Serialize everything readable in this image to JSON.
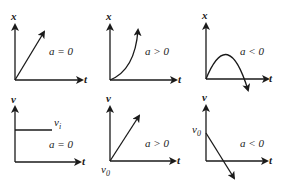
{
  "panels": [
    {
      "id": "x-t-uniform",
      "y_label": "x",
      "x_label": "t",
      "condition": "a = 0",
      "shape": "straight-rising"
    },
    {
      "id": "x-t-accelerating",
      "y_label": "x",
      "x_label": "t",
      "condition": "a > 0",
      "shape": "concave-up-curve"
    },
    {
      "id": "x-t-decelerating",
      "y_label": "x",
      "x_label": "t",
      "condition": "a < 0",
      "shape": "downward-parabola"
    },
    {
      "id": "v-t-uniform",
      "y_label": "v",
      "x_label": "t",
      "condition": "a = 0",
      "shape": "horizontal-line",
      "line_label": "v",
      "line_label_sub": "i"
    },
    {
      "id": "v-t-accelerating",
      "y_label": "v",
      "x_label": "t",
      "condition": "a > 0",
      "shape": "straight-rising",
      "origin_label": "v",
      "origin_label_sub": "0"
    },
    {
      "id": "v-t-decelerating",
      "y_label": "v",
      "x_label": "t",
      "condition": "a < 0",
      "shape": "straight-falling",
      "intercept_label": "v",
      "intercept_label_sub": "0"
    }
  ],
  "colors": {
    "ink": "#1a1a1a",
    "background": "#ffffff"
  }
}
